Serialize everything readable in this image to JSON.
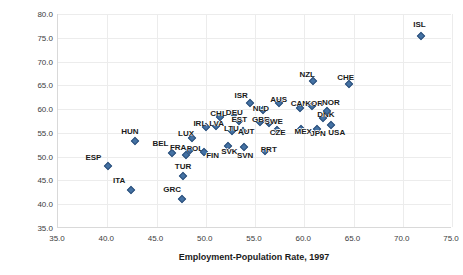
{
  "chart_data": {
    "type": "scatter",
    "title": "",
    "xlabel": "Employment-Population Rate, 1997",
    "ylabel": "Employment-Population-Rate, 2017",
    "xlim": [
      35.0,
      75.0
    ],
    "ylim": [
      35.0,
      80.0
    ],
    "xticks": [
      "35.0",
      "40.0",
      "45.0",
      "50.0",
      "55.0",
      "60.0",
      "65.0",
      "70.0",
      "75.0"
    ],
    "yticks": [
      "35.0",
      "40.0",
      "45.0",
      "50.0",
      "55.0",
      "60.0",
      "65.0",
      "70.0",
      "75.0",
      "80.0"
    ],
    "grid": true,
    "legend": "none",
    "marker": {
      "shape": "diamond",
      "color": "#4472a4",
      "edge": "#30537d"
    },
    "points": [
      {
        "label": "ESP",
        "x": 40.1,
        "y": 48.0,
        "lx": 38.6,
        "ly": 50.0
      },
      {
        "label": "ITA",
        "x": 42.4,
        "y": 43.0,
        "lx": 41.2,
        "ly": 45.0
      },
      {
        "label": "HUN",
        "x": 42.8,
        "y": 53.2,
        "lx": 42.3,
        "ly": 55.3
      },
      {
        "label": "BEL",
        "x": 46.6,
        "y": 50.7,
        "lx": 45.4,
        "ly": 52.8
      },
      {
        "label": "GRC",
        "x": 47.6,
        "y": 41.2,
        "lx": 46.6,
        "ly": 43.3
      },
      {
        "label": "TUR",
        "x": 47.7,
        "y": 45.9,
        "lx": 47.7,
        "ly": 48.0
      },
      {
        "label": "FRA",
        "x": 48.0,
        "y": 50.3,
        "lx": 47.2,
        "ly": 52.0
      },
      {
        "label": "POL",
        "x": 48.4,
        "y": 51.3,
        "lx": 48.9,
        "ly": 51.9
      },
      {
        "label": "LUX",
        "x": 48.6,
        "y": 54.0,
        "lx": 48.0,
        "ly": 55.0
      },
      {
        "label": "IRL",
        "x": 50.0,
        "y": 56.2,
        "lx": 49.4,
        "ly": 57.0
      },
      {
        "label": "FIN",
        "x": 49.8,
        "y": 51.0,
        "lx": 50.7,
        "ly": 50.4
      },
      {
        "label": "LVA",
        "x": 51.0,
        "y": 56.5,
        "lx": 51.1,
        "ly": 57.1
      },
      {
        "label": "CHL",
        "x": 51.4,
        "y": 58.3,
        "lx": 51.3,
        "ly": 59.1
      },
      {
        "label": "SVK",
        "x": 52.3,
        "y": 52.2,
        "lx": 52.4,
        "ly": 51.2
      },
      {
        "label": "LTU",
        "x": 52.7,
        "y": 55.4,
        "lx": 52.6,
        "ly": 56.1
      },
      {
        "label": "DEU",
        "x": 52.9,
        "y": 59.0,
        "lx": 52.9,
        "ly": 59.3
      },
      {
        "label": "EST",
        "x": 53.4,
        "y": 57.4,
        "lx": 53.4,
        "ly": 58.0
      },
      {
        "label": "AUT",
        "x": 53.8,
        "y": 55.4,
        "lx": 54.1,
        "ly": 55.5
      },
      {
        "label": "SVN",
        "x": 53.9,
        "y": 52.0,
        "lx": 54.0,
        "ly": 50.4
      },
      {
        "label": "ISR",
        "x": 54.5,
        "y": 61.3,
        "lx": 53.6,
        "ly": 63.0
      },
      {
        "label": "GBR",
        "x": 55.5,
        "y": 57.2,
        "lx": 55.6,
        "ly": 58.0
      },
      {
        "label": "NLD",
        "x": 55.8,
        "y": 59.8,
        "lx": 55.6,
        "ly": 60.3
      },
      {
        "label": "SWE",
        "x": 56.4,
        "y": 57.0,
        "lx": 56.9,
        "ly": 57.5
      },
      {
        "label": "PRT",
        "x": 56.0,
        "y": 51.2,
        "lx": 56.4,
        "ly": 51.6
      },
      {
        "label": "CZE",
        "x": 57.2,
        "y": 55.6,
        "lx": 57.3,
        "ly": 55.2
      },
      {
        "label": "AUS",
        "x": 57.4,
        "y": 61.2,
        "lx": 57.4,
        "ly": 62.2
      },
      {
        "label": "CAN",
        "x": 59.6,
        "y": 60.3,
        "lx": 59.5,
        "ly": 61.2
      },
      {
        "label": "MEX",
        "x": 59.7,
        "y": 55.8,
        "lx": 59.9,
        "ly": 55.5
      },
      {
        "label": "KOR",
        "x": 60.8,
        "y": 60.7,
        "lx": 61.0,
        "ly": 61.2
      },
      {
        "label": "NZL",
        "x": 60.9,
        "y": 66.0,
        "lx": 60.3,
        "ly": 67.4
      },
      {
        "label": "JPN",
        "x": 61.3,
        "y": 55.8,
        "lx": 61.4,
        "ly": 55.0
      },
      {
        "label": "DNK",
        "x": 61.9,
        "y": 58.2,
        "lx": 62.2,
        "ly": 58.9
      },
      {
        "label": "NOR",
        "x": 62.3,
        "y": 59.7,
        "lx": 62.7,
        "ly": 61.4
      },
      {
        "label": "USA",
        "x": 62.7,
        "y": 56.6,
        "lx": 63.3,
        "ly": 55.2
      },
      {
        "label": "CHE",
        "x": 64.5,
        "y": 65.3,
        "lx": 64.2,
        "ly": 66.8
      },
      {
        "label": "ISL",
        "x": 71.9,
        "y": 75.3,
        "lx": 71.7,
        "ly": 78.0
      }
    ]
  }
}
